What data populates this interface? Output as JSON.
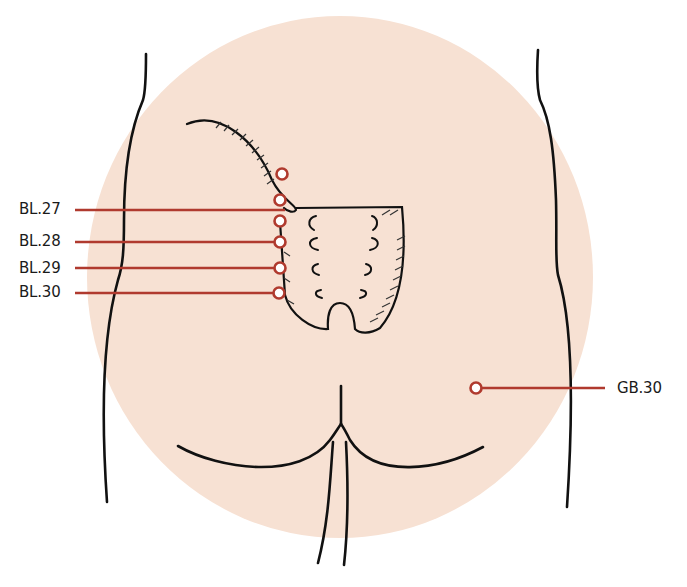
{
  "figure": {
    "colors": {
      "region_fill": "#F7E1D3",
      "outline": "#111111",
      "point_marker": "#B03A2E",
      "leader_line": "#B03A2E",
      "marker_center": "#FFFFFF",
      "label_text": "#1A1A1A"
    },
    "highlight_region": {
      "shape": "ellipse",
      "cx": 340,
      "cy": 277,
      "rx": 253,
      "ry": 261
    },
    "points": [
      {
        "id": "BL.27",
        "label": "BL.27",
        "marker": [
          280,
          200
        ],
        "label_pos": [
          19,
          202
        ],
        "leader_y": 210,
        "leader_end_x": 285
      },
      {
        "id": "BL.28",
        "label": "BL.28",
        "marker": [
          280,
          242
        ],
        "label_pos": [
          19,
          234
        ],
        "leader_y": 242,
        "leader_end_x": 275
      },
      {
        "id": "BL.29",
        "label": "BL.29",
        "marker": [
          280,
          268
        ],
        "label_pos": [
          19,
          261
        ],
        "leader_y": 268,
        "leader_end_x": 275
      },
      {
        "id": "BL.30",
        "label": "BL.30",
        "marker": [
          279,
          293
        ],
        "label_pos": [
          19,
          285
        ],
        "leader_y": 293,
        "leader_end_x": 274
      },
      {
        "id": "GB.30",
        "label": "GB.30",
        "marker": [
          476,
          388
        ],
        "label_pos": [
          617,
          381
        ],
        "leader_y": 388,
        "leader_end_x": 605
      }
    ],
    "unlabeled_markers": [
      {
        "marker": [
          282,
          174
        ]
      },
      {
        "marker": [
          280,
          221
        ]
      }
    ]
  }
}
